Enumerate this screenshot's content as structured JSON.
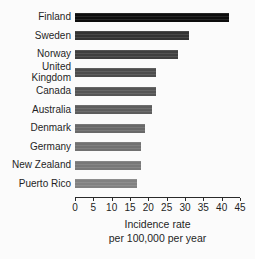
{
  "chart_data": {
    "type": "bar",
    "orientation": "horizontal",
    "categories": [
      "Finland",
      "Sweden",
      "Norway",
      "United Kingdom",
      "Canada",
      "Australia",
      "Denmark",
      "Germany",
      "New Zealand",
      "Puerto Rico"
    ],
    "values": [
      42,
      31,
      28,
      22,
      22,
      21,
      19,
      18,
      18,
      17
    ],
    "bar_colors": [
      "#0d0d0d",
      "#333333",
      "#3f3f3f",
      "#4d4d4d",
      "#555555",
      "#5d5d5d",
      "#696969",
      "#717171",
      "#787878",
      "#818181"
    ],
    "xlim": [
      0,
      45
    ],
    "xticks": [
      0,
      5,
      10,
      15,
      20,
      25,
      30,
      35,
      40,
      45
    ],
    "xlabel": "Incidence rate per 100,000 per year",
    "xlabel_line1": "Incidence rate",
    "xlabel_line2": "per 100,000 per year",
    "grid": false,
    "legend": false
  },
  "colors": {
    "background": "#fbfbfb",
    "axis": "#2a2a2a",
    "text": "#1f1f1f"
  }
}
